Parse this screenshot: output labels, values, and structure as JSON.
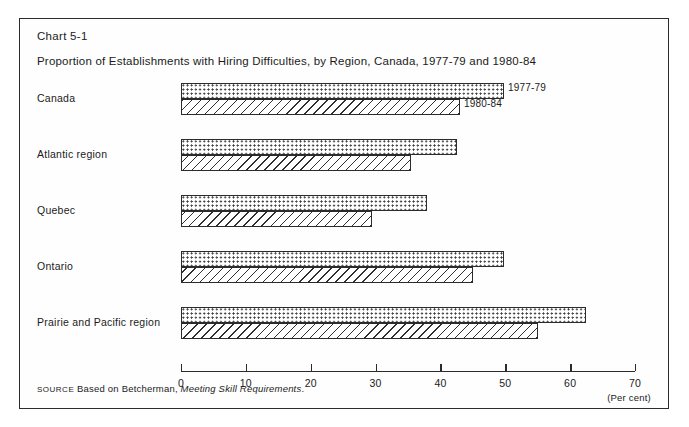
{
  "figure": {
    "chart_number": "Chart 5-1",
    "title": "Proportion of Establishments with Hiring Difficulties, by Region, Canada, 1977-79 and 1980-84",
    "source_label": "SOURCE",
    "source_prefix": "Based on Betcherman,",
    "source_italic": "Meeting Skill Requirements",
    "source_suffix": "."
  },
  "axis": {
    "unit_label": "(Per cent)",
    "ticks": [
      "0",
      "10",
      "20",
      "30",
      "40",
      "50",
      "60",
      "70"
    ]
  },
  "legend": {
    "series_a_label": "1977-79",
    "series_b_label": "1980-84"
  },
  "chart_data": {
    "type": "bar",
    "orientation": "horizontal",
    "title": "Proportion of Establishments with Hiring Difficulties, by Region, Canada, 1977-79 and 1980-84",
    "xlabel": "(Per cent)",
    "ylabel": "",
    "xlim": [
      0,
      70
    ],
    "xticks": [
      0,
      10,
      20,
      30,
      40,
      50,
      60,
      70
    ],
    "grid": false,
    "legend_position": "inline-right-of-first-group",
    "categories": [
      "Canada",
      "Atlantic region",
      "Quebec",
      "Ontario",
      "Prairie and Pacific region"
    ],
    "series": [
      {
        "name": "1977-79",
        "pattern": "dotted",
        "values": [
          49.8,
          42.5,
          38.0,
          49.8,
          62.5
        ]
      },
      {
        "name": "1980-84",
        "pattern": "diagonal-hatch",
        "values": [
          43.0,
          35.5,
          29.5,
          45.0,
          55.0
        ]
      }
    ]
  },
  "colors": {
    "frame": "#2b2b2b",
    "ink": "#1b1b1b",
    "background": "#ffffff"
  }
}
